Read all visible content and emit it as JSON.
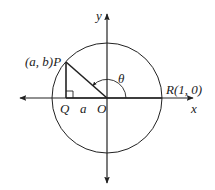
{
  "diagram": {
    "type": "unit-circle",
    "axes": {
      "x_label": "x",
      "y_label": "y"
    },
    "points": {
      "origin": {
        "label": "O"
      },
      "P": {
        "label": "P",
        "coords_label": "(a, b)",
        "full_label": "(a, b)P"
      },
      "Q": {
        "label": "Q"
      },
      "R": {
        "label": "R(1, 0)",
        "name": "R",
        "coords": [
          1,
          0
        ]
      }
    },
    "segments": [
      {
        "name": "OP",
        "description": "radius to P"
      },
      {
        "name": "PQ",
        "description": "perpendicular from P to x-axis"
      },
      {
        "name": "OR",
        "description": "radius along positive x-axis"
      }
    ],
    "labels": {
      "segment_QO": "a",
      "angle": "θ"
    },
    "angle": {
      "name": "theta",
      "from": "OR",
      "to": "OP",
      "direction": "counterclockwise"
    },
    "right_angle_at": "Q",
    "colors": {
      "stroke": "#222222",
      "background": "#ffffff"
    }
  }
}
